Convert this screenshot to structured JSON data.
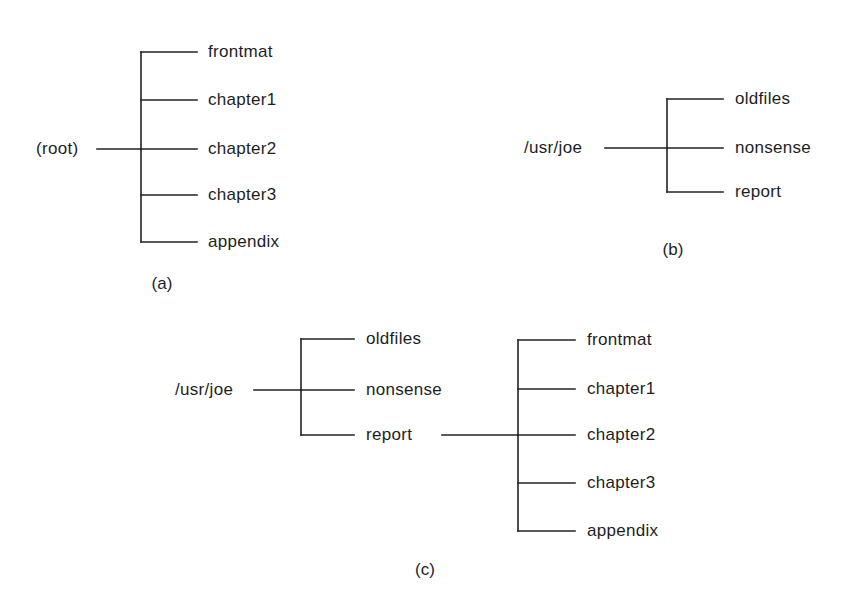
{
  "colors": {
    "line": "#222222",
    "text": "#1e1e1e",
    "background": "#ffffff"
  },
  "diagrams": {
    "a": {
      "caption": "(a)",
      "root": "(root)",
      "children": [
        "frontmat",
        "chapter1",
        "chapter2",
        "chapter3",
        "appendix"
      ]
    },
    "b": {
      "caption": "(b)",
      "root": "/usr/joe",
      "children": [
        "oldfiles",
        "nonsense",
        "report"
      ]
    },
    "c": {
      "caption": "(c)",
      "root": "/usr/joe",
      "children": [
        "oldfiles",
        "nonsense",
        "report"
      ],
      "subtree": {
        "parent": "report",
        "children": [
          "frontmat",
          "chapter1",
          "chapter2",
          "chapter3",
          "appendix"
        ]
      }
    }
  }
}
